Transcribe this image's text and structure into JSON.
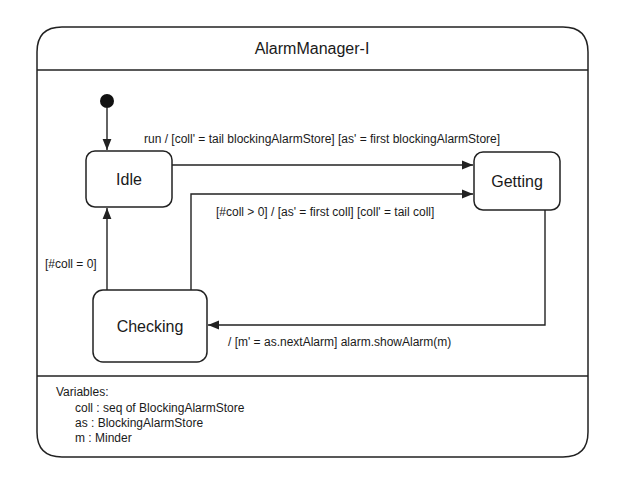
{
  "diagram": {
    "title": "AlarmManager-I",
    "type": "state-machine",
    "states": {
      "idle": "Idle",
      "getting": "Getting",
      "checking": "Checking"
    },
    "initial_state": "Idle",
    "transitions": [
      {
        "from": "Idle",
        "to": "Getting",
        "label": "run / [coll' = tail blockingAlarmStore] [as' = first blockingAlarmStore]"
      },
      {
        "from": "Checking",
        "to": "Getting",
        "label": "[#coll > 0] / [as' = first coll] [coll' = tail coll]"
      },
      {
        "from": "Checking",
        "to": "Idle",
        "label": "[#coll = 0]"
      },
      {
        "from": "Getting",
        "to": "Checking",
        "label": "/ [m' = as.nextAlarm] alarm.showAlarm(m)"
      }
    ],
    "variables": {
      "heading": "Variables:",
      "items": [
        "coll : seq of BlockingAlarmStore",
        "as : BlockingAlarmStore",
        "m : Minder"
      ]
    }
  }
}
